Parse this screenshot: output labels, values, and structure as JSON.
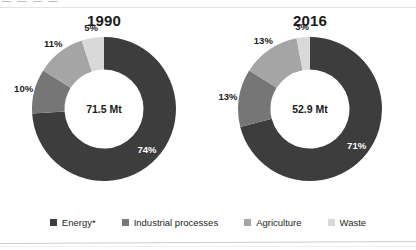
{
  "page": {
    "top_cropped_text": "— — — —",
    "background": "#ffffff"
  },
  "colors": {
    "energy": "#3d3d3d",
    "industrial_processes": "#767676",
    "agriculture": "#a5a5a5",
    "waste": "#d9d9d9",
    "label_on_dark": "#ffffff",
    "label_on_light": "#1b1b1b"
  },
  "legend": {
    "items": [
      {
        "label": "Energy*",
        "color": "#3d3d3d",
        "swatch_name": "legend-swatch-energy"
      },
      {
        "label": "Industrial processes",
        "color": "#767676",
        "swatch_name": "legend-swatch-industrial-processes"
      },
      {
        "label": "Agriculture",
        "color": "#a5a5a5",
        "swatch_name": "legend-swatch-agriculture"
      },
      {
        "label": "Waste",
        "color": "#d9d9d9",
        "swatch_name": "legend-swatch-waste"
      }
    ]
  },
  "chart_data": [
    {
      "type": "pie",
      "title": "1990",
      "center_label": "71.5 Mt",
      "total": 71.5,
      "units": "Mt",
      "categories": [
        "Energy*",
        "Industrial processes",
        "Agriculture",
        "Waste"
      ],
      "values": [
        74,
        10,
        11,
        5
      ],
      "labels": [
        "74%",
        "10%",
        "11%",
        "5%"
      ],
      "colors": [
        "#3d3d3d",
        "#767676",
        "#a5a5a5",
        "#d9d9d9"
      ],
      "xlabel": "",
      "ylabel": "",
      "legend_position": "bottom",
      "grid": false,
      "donut_hole_ratio": 0.55,
      "start_angle_deg": 0
    },
    {
      "type": "pie",
      "title": "2016",
      "center_label": "52.9 Mt",
      "total": 52.9,
      "units": "Mt",
      "categories": [
        "Energy*",
        "Industrial processes",
        "Agriculture",
        "Waste"
      ],
      "values": [
        71,
        13,
        13,
        3
      ],
      "labels": [
        "71%",
        "13%",
        "13%",
        "3%"
      ],
      "colors": [
        "#3d3d3d",
        "#767676",
        "#a5a5a5",
        "#d9d9d9"
      ],
      "xlabel": "",
      "ylabel": "",
      "legend_position": "bottom",
      "grid": false,
      "donut_hole_ratio": 0.55,
      "start_angle_deg": 0
    }
  ]
}
